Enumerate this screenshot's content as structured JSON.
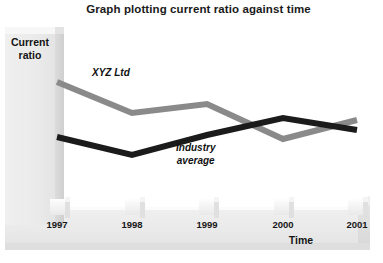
{
  "title": "Graph plotting current ratio against time",
  "axes": {
    "y_label": "Current\nratio",
    "x_title": "Time",
    "tick_labels": [
      "1997",
      "1998",
      "1999",
      "2000",
      "2001"
    ]
  },
  "annotations": {
    "xyz": "XYZ Ltd",
    "industry": "Industry\naverage"
  },
  "colors": {
    "xyz_line": "#8a8a8a",
    "industry_line": "#1b1b1b",
    "panel": "#ebebeb",
    "floor": "#eaeaea",
    "text": "#141414"
  },
  "chart_data": {
    "type": "line",
    "title": "Graph plotting current ratio against time",
    "xlabel": "Time",
    "ylabel": "Current ratio",
    "grid": false,
    "legend": "inline-annotations",
    "categories": [
      "1997",
      "1998",
      "1999",
      "2000",
      "2001"
    ],
    "ylim": [
      0,
      10
    ],
    "yticks_shown": false,
    "series": [
      {
        "name": "XYZ Ltd",
        "color": "#8a8a8a",
        "values": [
          7.3,
          5.6,
          6.1,
          4.2,
          5.2
        ],
        "pixel_y": [
          82,
          113,
          104,
          139,
          120
        ]
      },
      {
        "name": "Industry average",
        "color": "#1b1b1b",
        "values": [
          4.2,
          3.2,
          4.3,
          5.2,
          4.6
        ],
        "pixel_y": [
          137,
          155,
          135,
          118,
          130
        ]
      }
    ],
    "pixel_x": [
      57,
      132,
      207,
      283,
      357
    ]
  }
}
